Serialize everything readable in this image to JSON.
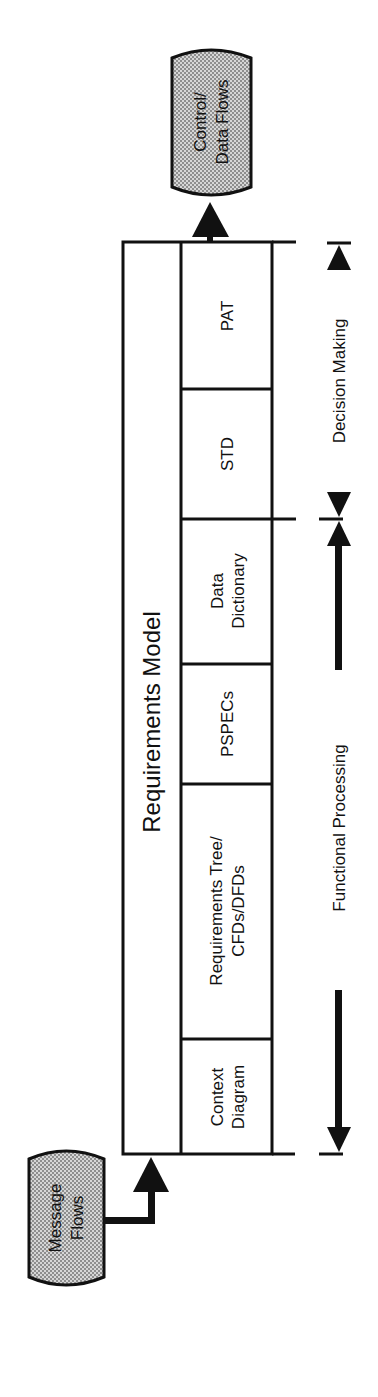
{
  "diagram": {
    "orientation": "rotated-90-ccw",
    "title": "Requirements Model",
    "input_terminator": {
      "line1": "Message",
      "line2": "Flows"
    },
    "output_terminator": {
      "line1": "Control/",
      "line2": "Data Flows"
    },
    "cells": [
      {
        "id": "context-diagram",
        "line1": "Context",
        "line2": "Diagram"
      },
      {
        "id": "requirements-tree",
        "line1": "Requirements Tree/",
        "line2": "CFDs/DFDs"
      },
      {
        "id": "pspecs",
        "line1": "PSPECs",
        "line2": ""
      },
      {
        "id": "data-dictionary",
        "line1": "Data",
        "line2": "Dictionary"
      },
      {
        "id": "std",
        "line1": "STD",
        "line2": ""
      },
      {
        "id": "pat",
        "line1": "PAT",
        "line2": ""
      }
    ],
    "ranges": [
      {
        "id": "functional-processing",
        "label": "Functional Processing",
        "spans": [
          "context-diagram",
          "requirements-tree",
          "pspecs",
          "data-dictionary"
        ]
      },
      {
        "id": "decision-making",
        "label": "Decision Making",
        "spans": [
          "std",
          "pat"
        ]
      }
    ],
    "colors": {
      "line": "#111111",
      "terminator_fill": "#b9b9b9",
      "background": "#ffffff"
    }
  }
}
